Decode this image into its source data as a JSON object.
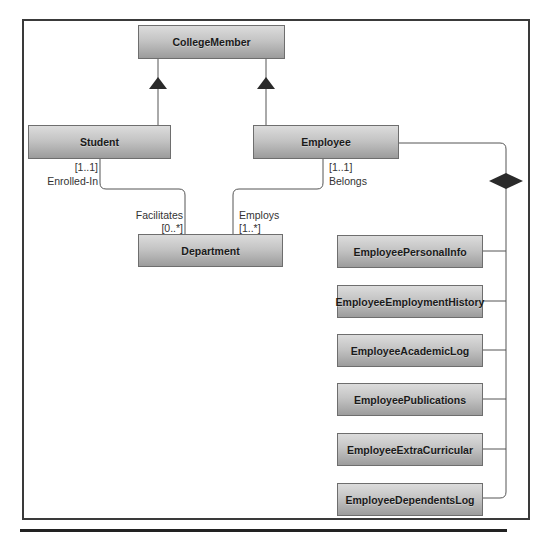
{
  "diagram": {
    "type": "UML class diagram",
    "classes": {
      "college_member": "CollegeMember",
      "student": "Student",
      "employee": "Employee",
      "department": "Department",
      "composed": [
        "EmployeePersonalInfo",
        "EmployeeEmploymentHistory",
        "EmployeeAcademicLog",
        "EmployeePublications",
        "EmployeeExtraCurricular",
        "EmployeeDependentsLog"
      ]
    },
    "associations": {
      "student_side": {
        "multiplicity": "[1..1]",
        "role": "Enrolled-In"
      },
      "department_student_side": {
        "role": "Facilitates",
        "multiplicity": "[0..*]"
      },
      "employee_side": {
        "multiplicity": "[1..1]",
        "role": "Belongs"
      },
      "department_employee_side": {
        "role": "Employs",
        "multiplicity": "[1..*]"
      }
    },
    "relationships": [
      {
        "from": "Student",
        "to": "CollegeMember",
        "kind": "generalization"
      },
      {
        "from": "Employee",
        "to": "CollegeMember",
        "kind": "generalization"
      },
      {
        "from": "Employee",
        "to": "EmployeeDetailClasses",
        "kind": "composition"
      }
    ],
    "colors": {
      "box_top": "#dcdcdc",
      "box_bottom": "#9c9c9c",
      "line": "#555555",
      "arrow": "#2a2a2a"
    }
  }
}
